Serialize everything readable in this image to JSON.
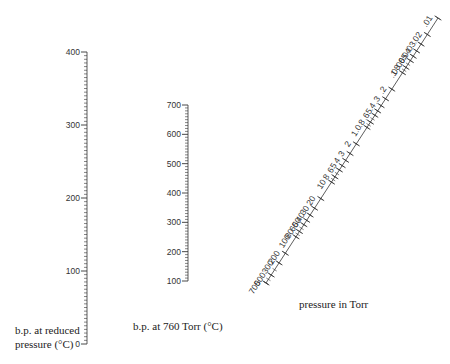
{
  "scales": {
    "reduced_bp": {
      "label_line1": "b.p. at reduced",
      "label_line2": "pressure (°C)",
      "ticks": [
        "0",
        "100",
        "200",
        "300",
        "400"
      ],
      "min": 0,
      "max": 400
    },
    "bp_760": {
      "label": "b.p. at 760 Torr (°C)",
      "ticks": [
        "100",
        "200",
        "300",
        "400",
        "500",
        "600",
        "700"
      ],
      "min": 100,
      "max": 700
    },
    "pressure": {
      "label": "pressure in Torr",
      "ticks": [
        ".01",
        ".02",
        ".03",
        ".04",
        ".05",
        ".06",
        ".08",
        ".1",
        ".2",
        ".3",
        ".4",
        ".5",
        ".6",
        ".8",
        "1.0",
        "2",
        "3",
        "4",
        "5",
        "6",
        "8",
        "10",
        "20",
        "30",
        "40",
        "50",
        "60",
        "80",
        "100",
        "200",
        "300",
        "500",
        "700"
      ]
    }
  },
  "colors": {
    "line": "#333333",
    "text": "#333333"
  }
}
